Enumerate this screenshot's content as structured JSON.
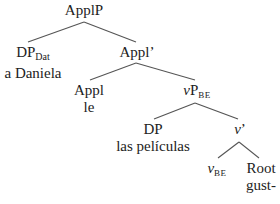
{
  "tree": {
    "root": {
      "label": "ApplP"
    },
    "dp_dat": {
      "label": "DP",
      "sub": "Dat",
      "word": "a Daniela"
    },
    "appl_bar": {
      "label": "Appl’"
    },
    "appl": {
      "label": "Appl",
      "word": "le"
    },
    "vp_be": {
      "label_v": "v",
      "label": "P",
      "sub": "BE"
    },
    "dp": {
      "label": "DP",
      "word": "las películas"
    },
    "v_bar": {
      "label_v": "v",
      "label": "’"
    },
    "v_be": {
      "label_v": "v",
      "sub": "BE"
    },
    "root_node": {
      "label": "Root",
      "word": "gust-"
    }
  }
}
